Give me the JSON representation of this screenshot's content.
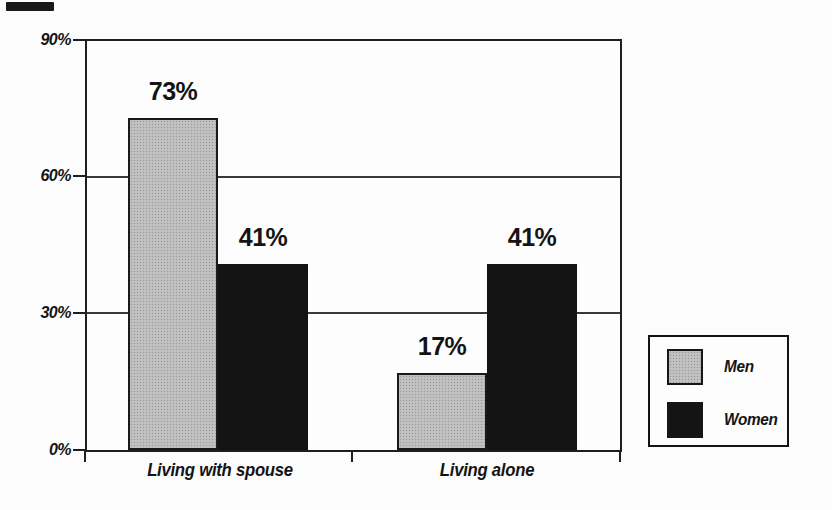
{
  "chart_data": {
    "type": "bar",
    "title": "",
    "categories": [
      "Living with spouse",
      "Living alone"
    ],
    "series": [
      {
        "name": "Men",
        "color": "#bdbdbd",
        "values": [
          73,
          17
        ],
        "labels": [
          "73%",
          "17%"
        ]
      },
      {
        "name": "Women",
        "color": "#141414",
        "values": [
          41,
          41
        ],
        "labels": [
          "41%",
          "41%"
        ]
      }
    ],
    "ylim": [
      0,
      90
    ],
    "yticks": [
      {
        "value": 90,
        "label": "90%"
      },
      {
        "value": 60,
        "label": "60%"
      },
      {
        "value": 30,
        "label": "30%"
      },
      {
        "value": 0,
        "label": "0%"
      }
    ],
    "grid": true,
    "legend_position": "right",
    "axis_color": "#1e1e1e",
    "background_color": "#fcfcfc"
  }
}
